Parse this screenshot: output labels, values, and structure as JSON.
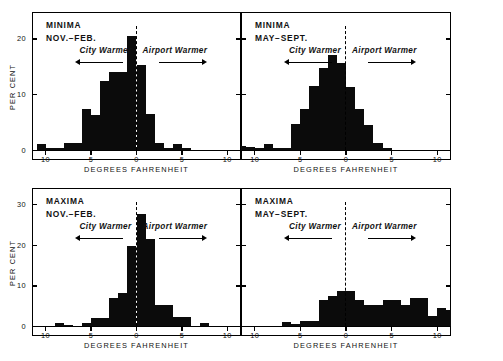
{
  "figure": {
    "background": "#ffffff",
    "ink": "#0b0b0b",
    "xaxis_label": "DEGREES FAHRENHEIT",
    "yaxis_label": "PER CENT"
  },
  "chart_data": [
    {
      "type": "bar",
      "panel_id": "minima-nov-feb",
      "title_line1": "MINIMA",
      "title_line2": "NOV.−FEB.",
      "left_annotation": "City Warmer",
      "right_annotation": "Airport Warmer",
      "xlabel": "DEGREES FAHRENHEIT",
      "ylabel": "PER CENT",
      "xlim": [
        -11.5,
        11.5
      ],
      "ylim": [
        0,
        24
      ],
      "xticks": [
        -10,
        -5,
        0,
        5,
        10
      ],
      "xticklabels": [
        "10",
        "5",
        "0",
        "5",
        "10"
      ],
      "yticks": [
        0,
        10,
        20
      ],
      "yticklabels": [
        "0",
        "10",
        "20"
      ],
      "grid": false,
      "bin_width": 1,
      "bin_centers": [
        -10.5,
        -9.5,
        -8.5,
        -7.5,
        -6.5,
        -5.5,
        -4.5,
        -3.5,
        -2.5,
        -1.5,
        -0.5,
        0.5,
        1.5,
        2.5,
        3.5,
        4.5,
        5.5
      ],
      "values": [
        1.0,
        0.3,
        0.3,
        1.2,
        1.2,
        7.3,
        6.3,
        12.4,
        13.9,
        13.9,
        20.5,
        15.2,
        6.4,
        1.2,
        0.3,
        1.1,
        0.3
      ],
      "notes": "Sharply peaked just left of zero; long left tail to -11."
    },
    {
      "type": "bar",
      "panel_id": "minima-may-sept",
      "title_line1": "MINIMA",
      "title_line2": "MAY−SEPT.",
      "left_annotation": "City Warmer",
      "right_annotation": "Airport Warmer",
      "xlabel": "DEGREES FAHRENHEIT",
      "ylabel": "PER CENT",
      "xlim": [
        -11.5,
        11.5
      ],
      "ylim": [
        0,
        24
      ],
      "xticks": [
        -10,
        -5,
        0,
        5,
        10
      ],
      "xticklabels": [
        "10",
        "5",
        "0",
        "5",
        "10"
      ],
      "yticks": [
        0,
        10,
        20
      ],
      "yticklabels": [
        "0",
        "10",
        "20"
      ],
      "grid": false,
      "bin_width": 1,
      "bin_centers": [
        -11.5,
        -10.5,
        -9.5,
        -8.5,
        -7.5,
        -6.5,
        -5.5,
        -4.5,
        -3.5,
        -2.5,
        -1.5,
        -0.5,
        0.5,
        1.5,
        2.5,
        3.5,
        4.5
      ],
      "values": [
        0.8,
        0.5,
        0.3,
        1.0,
        0.4,
        0.4,
        4.6,
        7.3,
        11.5,
        14.6,
        17.0,
        15.6,
        11.2,
        7.3,
        4.5,
        1.3,
        0.3
      ],
      "notes": "Broad, near-symmetric bell centred slightly left of zero."
    },
    {
      "type": "bar",
      "panel_id": "maxima-nov-feb",
      "title_line1": "MAXIMA",
      "title_line2": "NOV.−FEB.",
      "left_annotation": "City Warmer",
      "right_annotation": "Airport Warmer",
      "xlabel": "DEGREES FAHRENHEIT",
      "ylabel": "PER CENT",
      "xlim": [
        -11.5,
        11.5
      ],
      "ylim": [
        0,
        33
      ],
      "xticks": [
        -10,
        -5,
        0,
        5,
        10
      ],
      "xticklabels": [
        "10",
        "5",
        "0",
        "5",
        "10"
      ],
      "yticks": [
        0,
        10,
        20,
        30
      ],
      "yticklabels": [
        "0",
        "10",
        "20",
        "30"
      ],
      "grid": false,
      "bin_width": 1,
      "bin_centers": [
        -8.5,
        -7.5,
        -5.5,
        -4.5,
        -3.5,
        -2.5,
        -1.5,
        -0.5,
        0.5,
        1.5,
        2.5,
        3.5,
        4.5,
        5.5,
        7.5
      ],
      "values": [
        0.7,
        0.3,
        0.8,
        2.0,
        2.0,
        6.8,
        8.2,
        19.8,
        27.5,
        21.5,
        5.2,
        5.2,
        2.3,
        2.3,
        0.7
      ],
      "notes": "Very sharp narrow peak straddling zero; max near 27.5 percent."
    },
    {
      "type": "bar",
      "panel_id": "maxima-may-sept",
      "title_line1": "MAXIMA",
      "title_line2": "MAY−SEPT.",
      "left_annotation": "City Warmer",
      "right_annotation": "Airport Warmer",
      "xlabel": "DEGREES FAHRENHEIT",
      "ylabel": "PER CENT",
      "xlim": [
        -11.5,
        11.5
      ],
      "ylim": [
        0,
        33
      ],
      "xticks": [
        -10,
        -5,
        0,
        5,
        10
      ],
      "xticklabels": [
        "10",
        "5",
        "0",
        "5",
        "10"
      ],
      "yticks": [
        0,
        10,
        20,
        30
      ],
      "yticklabels": [
        "0",
        "10",
        "20",
        "30"
      ],
      "grid": false,
      "bin_width": 1,
      "bin_centers": [
        -6.5,
        -5.5,
        -4.5,
        -3.5,
        -2.5,
        -1.5,
        -0.5,
        0.5,
        1.5,
        2.5,
        3.5,
        4.5,
        5.5,
        6.5,
        7.5,
        8.5,
        9.5,
        10.5,
        11.5
      ],
      "values": [
        0.9,
        0.6,
        1.3,
        1.3,
        6.3,
        7.3,
        8.6,
        8.6,
        6.4,
        5.2,
        5.2,
        6.4,
        6.4,
        5.2,
        6.8,
        6.8,
        2.5,
        4.4,
        4.0
      ],
      "notes": "Broad plateau skewed strongly to the airport-warmer side, extending past +11."
    }
  ]
}
